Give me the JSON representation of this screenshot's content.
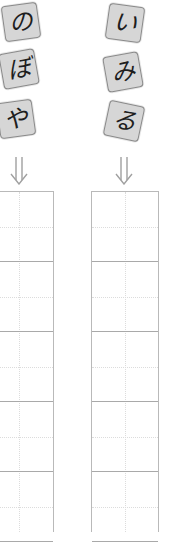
{
  "columns": [
    {
      "id": "left",
      "tiles": [
        {
          "char": "の"
        },
        {
          "char": "ぼ"
        },
        {
          "char": "や"
        }
      ],
      "arrow_icon": "double-down-arrow-icon"
    },
    {
      "id": "right",
      "tiles": [
        {
          "char": "い"
        },
        {
          "char": "み"
        },
        {
          "char": "る"
        }
      ],
      "arrow_icon": "double-down-arrow-icon"
    }
  ],
  "colors": {
    "tile_fill": "#d6d6d6",
    "tile_border": "#8a8a8a",
    "glyph": "#1e1e1e",
    "arrow": "#a0a0a0",
    "grid_line": "#b9b9b9",
    "grid_guide": "#dcdcdc"
  },
  "grid": {
    "cell_count_visible": 5
  }
}
